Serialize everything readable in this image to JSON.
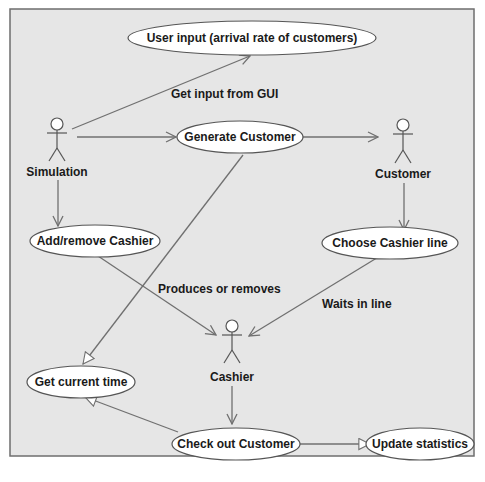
{
  "diagram": {
    "type": "use-case",
    "colors": {
      "background": "#e6e6e6",
      "border": "#6e6e6e",
      "line": "#707070",
      "ellipse_fill": "#ffffff",
      "text": "#1a1a1a"
    },
    "actors": [
      {
        "id": "simulation",
        "label": "Simulation"
      },
      {
        "id": "customer",
        "label": "Customer"
      },
      {
        "id": "cashier",
        "label": "Cashier"
      }
    ],
    "use_cases": [
      {
        "id": "user_input",
        "label": "User input (arrival rate of customers)"
      },
      {
        "id": "generate_customer",
        "label": "Generate Customer"
      },
      {
        "id": "add_remove_cashier",
        "label": "Add/remove Cashier"
      },
      {
        "id": "choose_cashier_line",
        "label": "Choose Cashier line"
      },
      {
        "id": "get_current_time",
        "label": "Get current time"
      },
      {
        "id": "check_out_customer",
        "label": "Check out Customer"
      },
      {
        "id": "update_statistics",
        "label": "Update statistics"
      }
    ],
    "edge_labels": {
      "get_input": "Get input from GUI",
      "produces_removes": "Produces or removes",
      "waits_in_line": "Waits in line"
    }
  }
}
